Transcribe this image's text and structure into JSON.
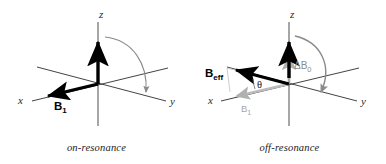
{
  "figure": {
    "title": "",
    "width": 386,
    "height": 164,
    "background": "#ffffff"
  },
  "colors": {
    "axis": "#333333",
    "vector_black": "#000000",
    "vector_gray": "#9a9a9a",
    "vector_gray_light": "#b3b3b3",
    "arc_gray": "#808080",
    "text": "#1a1a1a"
  },
  "panels": [
    {
      "id": "on-resonance",
      "caption": "on-resonance",
      "axes": [
        {
          "name": "z-axis",
          "label": "z"
        },
        {
          "name": "x-axis",
          "label": "x"
        },
        {
          "name": "y-axis",
          "label": "y"
        }
      ],
      "vectors": [
        {
          "name": "z-field-vector",
          "label": "",
          "color": "#000000"
        },
        {
          "name": "b1-vector",
          "label": "B",
          "sub": "1",
          "color": "#000000"
        }
      ],
      "arcs": [
        {
          "name": "nutation-arc",
          "label": "",
          "color": "#808080",
          "description": "curved arrow from z toward y"
        }
      ]
    },
    {
      "id": "off-resonance",
      "caption": "off-resonance",
      "axes": [
        {
          "name": "z-axis",
          "label": "z"
        },
        {
          "name": "x-axis",
          "label": "x"
        },
        {
          "name": "y-axis",
          "label": "y"
        }
      ],
      "vectors": [
        {
          "name": "beff-vector",
          "label": "B",
          "sub": "eff",
          "color": "#000000"
        },
        {
          "name": "b1-vector",
          "label": "B",
          "sub": "1",
          "color": "#a6a6a6"
        },
        {
          "name": "deltab0-vector",
          "label": "ΔB",
          "sub": "0",
          "color": "#8c8c8c"
        }
      ],
      "angles": [
        {
          "name": "theta-angle",
          "label": "θ"
        }
      ],
      "arcs": [
        {
          "name": "nutation-arc",
          "label": "",
          "color": "#808080",
          "description": "curved arrow about B_eff"
        }
      ]
    }
  ],
  "labels": {
    "z": "z",
    "x": "x",
    "y": "y",
    "b1": "B",
    "b1_sub": "1",
    "beff": "B",
    "beff_sub": "eff",
    "db0": "ΔB",
    "db0_sub": "0",
    "theta": "θ",
    "caption_left": "on-resonance",
    "caption_right": "off-resonance"
  }
}
